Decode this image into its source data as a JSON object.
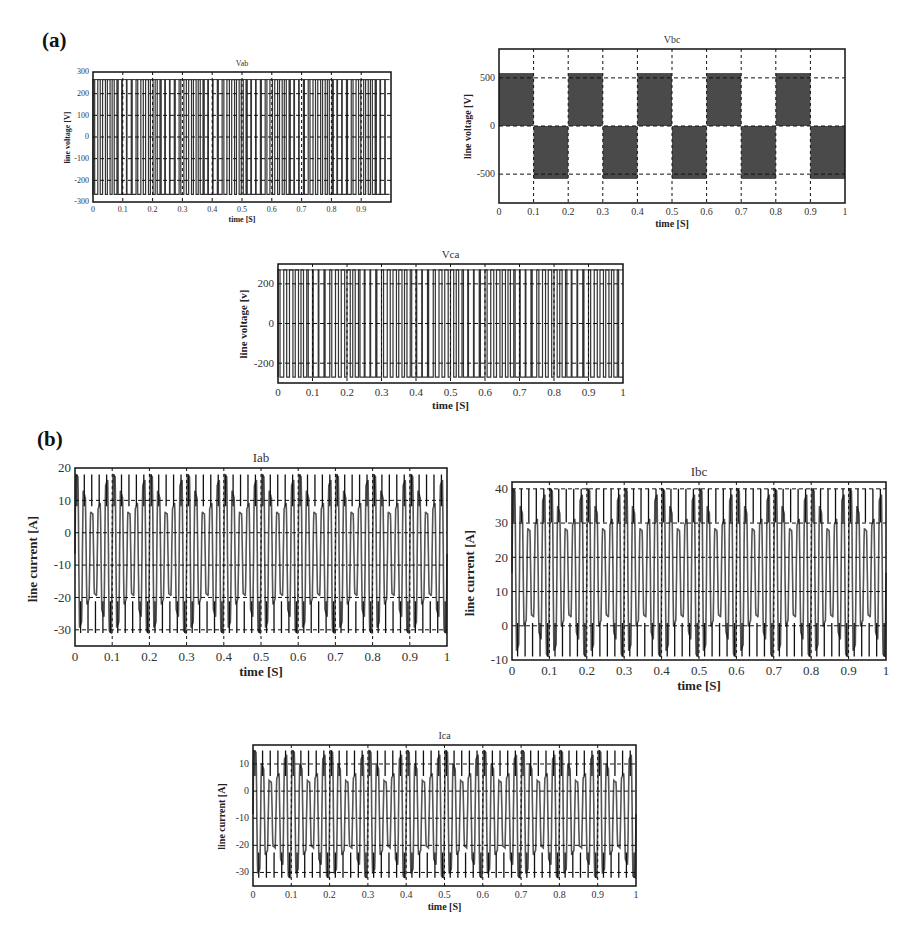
{
  "panels": [
    {
      "label": "(a)"
    },
    {
      "label": "(b)"
    }
  ],
  "chart_data": [
    {
      "id": "vab",
      "type": "line",
      "title": "Vab",
      "xlabel": "time [S]",
      "ylabel": "line voltage [V]",
      "xlim": [
        0,
        1
      ],
      "ylim": [
        -300,
        300
      ],
      "xticks": [
        "0",
        "0.1",
        "0.2",
        "0.3",
        "0.4",
        "0.5",
        "0.6",
        "0.7",
        "0.8",
        "0.9"
      ],
      "yticks": [
        "300",
        "200",
        "100",
        "0",
        "-100",
        "-200",
        "-300"
      ],
      "grid": true,
      "series": [
        {
          "name": "Vab",
          "description": "PWM square pulses switching between -265 V and +265 V",
          "high": 265,
          "low": -265,
          "pulses": 62
        }
      ]
    },
    {
      "id": "vbc",
      "type": "line",
      "title": "Vbc",
      "xlabel": "time [S]",
      "ylabel": "line voltage [V]",
      "xlim": [
        0,
        1
      ],
      "ylim": [
        -800,
        800
      ],
      "xticks": [
        "0",
        "0.1",
        "0.2",
        "0.3",
        "0.4",
        "0.5",
        "0.6",
        "0.7",
        "0.8",
        "0.9",
        "1"
      ],
      "yticks": [
        "500",
        "0",
        "-500"
      ],
      "grid": true,
      "series": [
        {
          "name": "Vbc",
          "description": "Alternating PWM blocks: 0 to +550 V then 0 to -550 V every 0.1 s",
          "blocks": [
            {
              "x0": 0.0,
              "x1": 0.1,
              "sign": 1
            },
            {
              "x0": 0.1,
              "x1": 0.2,
              "sign": -1
            },
            {
              "x0": 0.2,
              "x1": 0.3,
              "sign": 1
            },
            {
              "x0": 0.3,
              "x1": 0.4,
              "sign": -1
            },
            {
              "x0": 0.4,
              "x1": 0.5,
              "sign": 1
            },
            {
              "x0": 0.5,
              "x1": 0.6,
              "sign": -1
            },
            {
              "x0": 0.6,
              "x1": 0.7,
              "sign": 1
            },
            {
              "x0": 0.7,
              "x1": 0.8,
              "sign": -1
            },
            {
              "x0": 0.8,
              "x1": 0.9,
              "sign": 1
            },
            {
              "x0": 0.9,
              "x1": 1.0,
              "sign": -1
            }
          ],
          "amplitude": 550
        }
      ]
    },
    {
      "id": "vca",
      "type": "line",
      "title": "Vca",
      "xlabel": "time [S]",
      "ylabel": "line voltage [v]",
      "xlim": [
        0,
        1
      ],
      "ylim": [
        -300,
        300
      ],
      "xticks": [
        "0",
        "0.1",
        "0.2",
        "0.3",
        "0.4",
        "0.5",
        "0.6",
        "0.7",
        "0.8",
        "0.9",
        "1"
      ],
      "yticks": [
        "200",
        "0",
        "-200"
      ],
      "grid": true,
      "series": [
        {
          "name": "Vca",
          "description": "PWM square pulses switching between -270 V and +270 V",
          "high": 270,
          "low": -270,
          "pulses": 60
        }
      ]
    },
    {
      "id": "iab",
      "type": "line",
      "title": "Iab",
      "xlabel": "time [S]",
      "ylabel": "line current [A]",
      "xlim": [
        0,
        1
      ],
      "ylim": [
        -35,
        20
      ],
      "xticks": [
        "0",
        "0.1",
        "0.2",
        "0.3",
        "0.4",
        "0.5",
        "0.6",
        "0.7",
        "0.8",
        "0.9",
        "1"
      ],
      "yticks": [
        "20",
        "10",
        "0",
        "-10",
        "-20",
        "-30"
      ],
      "grid": true,
      "series": [
        {
          "name": "Iab",
          "description": "Oscillating current between about -31 A and +18 A",
          "max": 18,
          "min": -31,
          "cycles": 50
        }
      ]
    },
    {
      "id": "ibc",
      "type": "line",
      "title": "Ibc",
      "xlabel": "time [S]",
      "ylabel": "line current [A]",
      "xlim": [
        0,
        1
      ],
      "ylim": [
        -10,
        42
      ],
      "xticks": [
        "0",
        "0.1",
        "0.2",
        "0.3",
        "0.4",
        "0.5",
        "0.6",
        "0.7",
        "0.8",
        "0.9",
        "1"
      ],
      "yticks": [
        "40",
        "30",
        "20",
        "10",
        "0",
        "-10"
      ],
      "grid": true,
      "series": [
        {
          "name": "Ibc",
          "description": "Oscillating current between about -9 A and +40 A",
          "max": 40,
          "min": -9,
          "cycles": 50
        }
      ]
    },
    {
      "id": "ica",
      "type": "line",
      "title": "Ica",
      "xlabel": "time [S]",
      "ylabel": "line current [A]",
      "xlim": [
        0,
        1
      ],
      "ylim": [
        -35,
        17
      ],
      "xticks": [
        "0",
        "0.1",
        "0.2",
        "0.3",
        "0.4",
        "0.5",
        "0.6",
        "0.7",
        "0.8",
        "0.9",
        "1"
      ],
      "yticks": [
        "10",
        "0",
        "-10",
        "-20",
        "-30"
      ],
      "grid": true,
      "series": [
        {
          "name": "Ica",
          "description": "Oscillating current between about -32 A and +15 A",
          "max": 15,
          "min": -32,
          "cycles": 50
        }
      ]
    }
  ]
}
